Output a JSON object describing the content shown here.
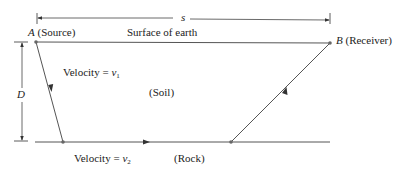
{
  "diagram": {
    "type": "seismic refraction schematic",
    "labels": {
      "distance_symbol": "s",
      "depth_symbol": "D",
      "point_a_letter": "A",
      "point_a_desc": "(Source)",
      "surface": "Surface of earth",
      "point_b_letter": "B",
      "point_b_desc": "(Receiver)",
      "velocity1_prefix": "Velocity = ",
      "velocity1_var": "v",
      "velocity1_sub": "1",
      "layer1": "(Soil)",
      "velocity2_prefix": "Velocity = ",
      "velocity2_var": "v",
      "velocity2_sub": "2",
      "layer2": "(Rock)"
    },
    "colors": {
      "line": "#555555",
      "text": "#222222",
      "point": "#666666",
      "background": "#ffffff"
    }
  }
}
